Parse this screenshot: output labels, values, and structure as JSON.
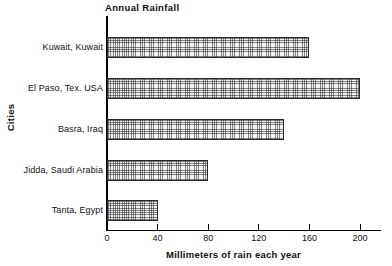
{
  "chart_data": {
    "type": "bar",
    "orientation": "horizontal",
    "title": "Annual Rainfall",
    "xlabel": "Millimeters of rain each year",
    "ylabel": "Cities",
    "categories": [
      "Kuwait, Kuwait",
      "El Paso, Tex. USA",
      "Basra, Iraq",
      "Jidda, Saudi Arabia",
      "Tanta, Egypt"
    ],
    "values": [
      160,
      200,
      140,
      80,
      40
    ],
    "xlim": [
      0,
      220
    ],
    "xticks": [
      0,
      40,
      80,
      120,
      160,
      200
    ],
    "xtick_labels": [
      "0",
      "40",
      "80",
      "120",
      "160",
      "200"
    ],
    "grid": false,
    "legend": false,
    "bar_fill": "#f2f2f2",
    "bar_edge": "#2b2b2b",
    "axis_color": "#000000"
  }
}
